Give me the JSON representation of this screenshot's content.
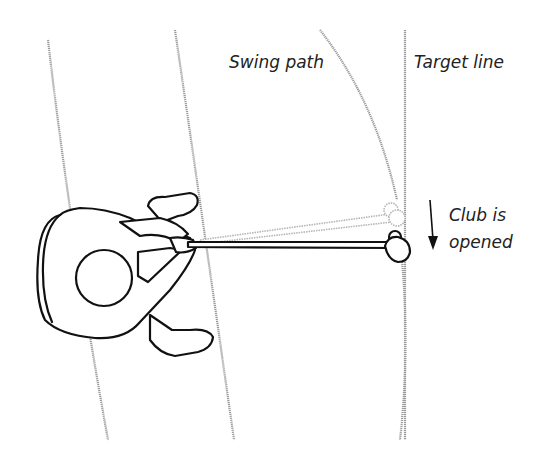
{
  "diagram": {
    "type": "golf swing illustration (top-down view)",
    "labels": {
      "swing_path": "Swing path",
      "target_line": "Target line",
      "club_line1": "Club is",
      "club_line2": "opened"
    },
    "colors": {
      "ink": "#111111",
      "guide_lines": "#9a9a9a",
      "ghost_club": "#b5b5b5",
      "text": "#222222",
      "background": "#ffffff"
    }
  }
}
